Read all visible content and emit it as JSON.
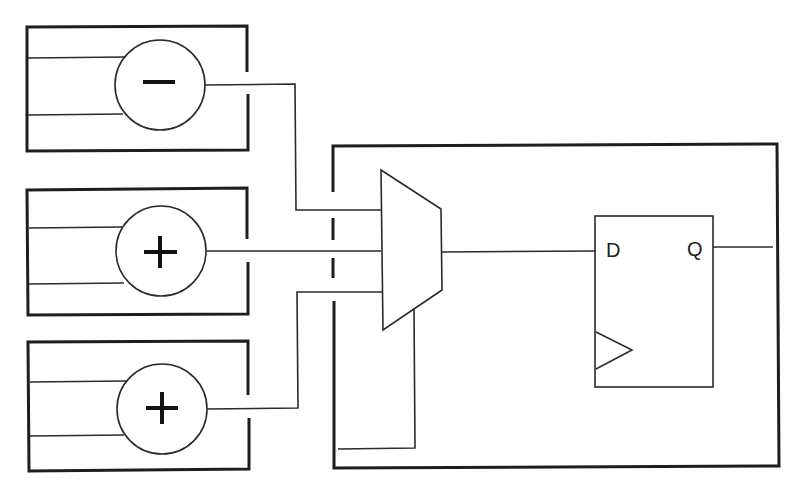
{
  "diagram": {
    "type": "digital-logic-block-diagram",
    "colors": {
      "stroke": "#1e1e1e",
      "background": "#ffffff"
    },
    "operator_blocks": [
      {
        "id": "block-1",
        "operator": "−",
        "operator_name": "subtract"
      },
      {
        "id": "block-2",
        "operator": "+",
        "operator_name": "add"
      },
      {
        "id": "block-3",
        "operator": "+",
        "operator_name": "add"
      }
    ],
    "mux": {
      "inputs": 3,
      "label": ""
    },
    "flip_flop": {
      "d_label": "D",
      "q_label": "Q",
      "clock_symbol": "triangle"
    }
  }
}
